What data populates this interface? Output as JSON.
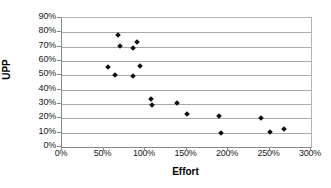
{
  "chart_data": {
    "type": "scatter",
    "title": "",
    "xlabel": "Effort",
    "ylabel": "UPP",
    "xlim": [
      0,
      300
    ],
    "ylim": [
      0,
      90
    ],
    "grid": true,
    "legend": false,
    "x_tick_labels": [
      "0%",
      "50%",
      "100%",
      "150%",
      "200%",
      "250%",
      "300%"
    ],
    "x_ticks": [
      0,
      50,
      100,
      150,
      200,
      250,
      300
    ],
    "y_tick_labels": [
      "0%",
      "10%",
      "20%",
      "30%",
      "40%",
      "50%",
      "60%",
      "70%",
      "80%",
      "90%"
    ],
    "y_ticks": [
      0,
      10,
      20,
      30,
      40,
      50,
      60,
      70,
      80,
      90
    ],
    "marker": "diamond",
    "marker_color": "#101010",
    "series": [
      {
        "name": "UPP vs Effort",
        "points": [
          {
            "x": 55,
            "y": 55.5
          },
          {
            "x": 64,
            "y": 50.0
          },
          {
            "x": 68,
            "y": 78.0
          },
          {
            "x": 70,
            "y": 70.5
          },
          {
            "x": 85,
            "y": 49.5
          },
          {
            "x": 86,
            "y": 69.0
          },
          {
            "x": 90,
            "y": 73.5
          },
          {
            "x": 94,
            "y": 56.5
          },
          {
            "x": 107,
            "y": 33.5
          },
          {
            "x": 108,
            "y": 29.5
          },
          {
            "x": 138,
            "y": 30.5
          },
          {
            "x": 150,
            "y": 23.0
          },
          {
            "x": 189,
            "y": 21.5
          },
          {
            "x": 192,
            "y": 10.0
          },
          {
            "x": 240,
            "y": 20.0
          },
          {
            "x": 250,
            "y": 10.5
          },
          {
            "x": 268,
            "y": 12.5
          }
        ]
      }
    ]
  },
  "axis": {
    "x_title": "Effort",
    "y_title": "UPP"
  }
}
